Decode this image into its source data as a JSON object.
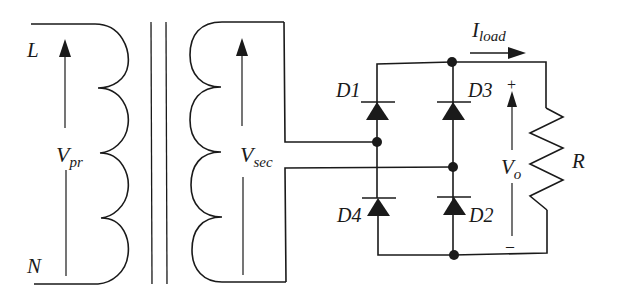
{
  "diagram": {
    "labels": {
      "line": "L",
      "neutral": "N",
      "v_primary_main": "V",
      "v_primary_sub": "pr",
      "v_secondary_main": "V",
      "v_secondary_sub": "sec",
      "diode_1": "D1",
      "diode_2": "D2",
      "diode_3": "D3",
      "diode_4": "D4",
      "current_main": "I",
      "current_sub": "load",
      "v_out_main": "V",
      "v_out_sub": "o",
      "resistor": "R",
      "plus": "+",
      "minus": "–"
    },
    "components": [
      {
        "id": "primary-winding",
        "type": "inductor",
        "turns": 4
      },
      {
        "id": "core",
        "type": "transformer-core",
        "lines": 2
      },
      {
        "id": "secondary-winding",
        "type": "inductor",
        "turns": 4
      },
      {
        "id": "D1",
        "type": "diode",
        "direction": "up"
      },
      {
        "id": "D2",
        "type": "diode",
        "direction": "up"
      },
      {
        "id": "D3",
        "type": "diode",
        "direction": "up"
      },
      {
        "id": "D4",
        "type": "diode",
        "direction": "up"
      },
      {
        "id": "R",
        "type": "resistor"
      }
    ],
    "colors": {
      "ink": "#1a1a1a",
      "background": "#ffffff"
    }
  }
}
